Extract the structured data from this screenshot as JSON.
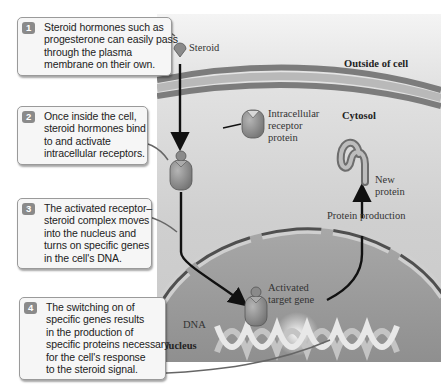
{
  "diagram": {
    "regions": {
      "outside": "Outside of cell",
      "cytosol": "Cytosol",
      "nucleus": "Nucleus"
    },
    "labels": {
      "steroid": "Steroid",
      "receptor": [
        "Intracellular",
        "receptor",
        "protein"
      ],
      "new_protein": [
        "New",
        "protein"
      ],
      "protein_production": "Protein production",
      "activated_gene": [
        "Activated",
        "target gene"
      ],
      "dna": "DNA"
    },
    "steps": [
      {
        "number": "1",
        "lines": [
          "Steroid hormones such as",
          "progesterone can easily pass",
          "through the plasma",
          "membrane on their own."
        ]
      },
      {
        "number": "2",
        "lines": [
          "Once inside the cell,",
          "steroid hormones bind",
          "to and activate",
          "intracellular receptors."
        ]
      },
      {
        "number": "3",
        "lines": [
          "The activated receptor–",
          "steroid complex moves",
          "into the nucleus and",
          "turns on specific genes",
          "in the cell's DNA."
        ]
      },
      {
        "number": "4",
        "lines": [
          "The switching on of",
          "specific genes results",
          "in the production of",
          "specific proteins necessary",
          "for the cell's response",
          "to the steroid signal."
        ]
      }
    ],
    "colors": {
      "background": "#ffffff",
      "callout_fill": "#f6f6f6",
      "callout_border": "#9a9a9a",
      "badge": "#8a8a8a",
      "membrane": "#7a7a7a",
      "cytosol": "#d0d0d0",
      "nucleus": "#9c9c9c",
      "arrow": "#111111"
    }
  }
}
